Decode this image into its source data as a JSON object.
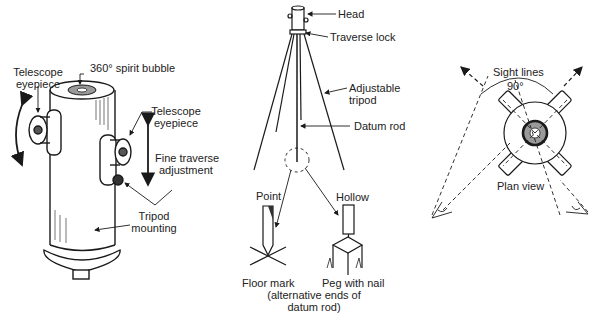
{
  "diagram": {
    "panels": [
      {
        "id": "instrument-head",
        "labels": {
          "spirit_bubble": "360° spirit bubble",
          "eyepiece_left_1": "Telescope",
          "eyepiece_left_2": "eyepiece",
          "eyepiece_right_1": "Telescope",
          "eyepiece_right_2": "eyepiece",
          "fine_traverse_1": "Fine traverse",
          "fine_traverse_2": "adjustment",
          "tripod_mount_1": "Tripod",
          "tripod_mount_2": "mounting"
        }
      },
      {
        "id": "tripod-setup",
        "labels": {
          "head": "Head",
          "traverse_lock": "Traverse lock",
          "adjustable_tripod_1": "Adjustable",
          "adjustable_tripod_2": "tripod",
          "datum_rod": "Datum rod",
          "point": "Point",
          "hollow": "Hollow",
          "floor_mark": "Floor mark",
          "peg_with_nail": "Peg with nail",
          "caption_1": "(alternative ends of",
          "caption_2": "datum rod)"
        }
      },
      {
        "id": "plan-view",
        "labels": {
          "sight_lines": "Sight lines",
          "angle": "90°",
          "plan_view": "Plan view"
        }
      }
    ],
    "colors": {
      "ink": "#1a1a1a",
      "bubble": "#9a9a9a",
      "background": "#ffffff"
    }
  }
}
